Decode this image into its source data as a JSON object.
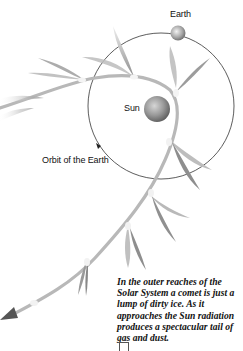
{
  "labels": {
    "earth": "Earth",
    "sun": "Sun",
    "orbit": "Orbit of the Earth"
  },
  "caption": "In the outer reaches of the Solar System a comet is just a lump of dirty ice. As it approaches the Sun radiation produces a spectacular tail of gas and dust.",
  "colors": {
    "background": "#ffffff",
    "orbit_line": "#333333",
    "comet_path": "#b5b5b5",
    "tail": "#a9a9a9",
    "sun": "#8c8c8c",
    "earth": "#9a9a9a",
    "text": "#111111"
  },
  "icons": {
    "orbit_direction": "triangle-arrow",
    "comet_direction": "arrowhead-left-down"
  }
}
